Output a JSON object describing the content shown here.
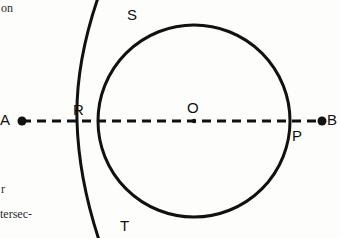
{
  "figure": {
    "kind": "geometry-construction-diagram",
    "background_color": "#fdfdfb",
    "ink_color": "#111111",
    "width": 340,
    "height": 238
  },
  "margin_text": {
    "top_fragment": "on",
    "middle_fragment": "r",
    "bottom_fragment": "tersec-"
  },
  "labels": {
    "A": "A",
    "B": "B",
    "R": "R",
    "S": "S",
    "T": "T",
    "O": "O",
    "P": "P"
  },
  "geometry": {
    "line_AB": {
      "style": "dashed",
      "x1": 22,
      "y1": 121,
      "x2": 322,
      "y2": 121,
      "dash_pattern": "9 6",
      "stroke_width": 3
    },
    "endpoint_dots": [
      {
        "name": "A",
        "cx": 22,
        "cy": 121,
        "r": 4.5
      },
      {
        "name": "B",
        "cx": 322,
        "cy": 121,
        "r": 4.5
      }
    ],
    "center_dot": {
      "name": "O",
      "cx": 194,
      "cy": 121,
      "r": 2.2
    },
    "circle": {
      "name": "circle-centered-O",
      "cx": 194,
      "cy": 121,
      "r": 96,
      "stroke_width": 3,
      "passes_through": [
        "R",
        "P"
      ]
    },
    "arc": {
      "name": "compass-arc-through-S-T",
      "cx": -22,
      "cy": 121,
      "r": 177,
      "stroke_width": 3,
      "passes_through": [
        "S",
        "T"
      ],
      "open_ends": "top and bottom of frame"
    },
    "points": [
      {
        "name": "R",
        "x": 98,
        "y": 121,
        "desc": "left intersection of circle and line AB"
      },
      {
        "name": "P",
        "x": 290,
        "y": 121,
        "desc": "right intersection of circle and line AB"
      },
      {
        "name": "O",
        "x": 194,
        "y": 121,
        "desc": "center of circle"
      },
      {
        "name": "S",
        "x": 134,
        "y": 41,
        "desc": "upper intersection of arc and circle"
      },
      {
        "name": "T",
        "x": 134,
        "y": 201,
        "desc": "lower intersection of arc and circle"
      },
      {
        "name": "A",
        "x": 22,
        "y": 121,
        "desc": "left endpoint of line"
      },
      {
        "name": "B",
        "x": 322,
        "y": 121,
        "desc": "right endpoint of line"
      }
    ]
  }
}
